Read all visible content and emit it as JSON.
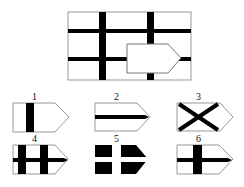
{
  "puzzle": {
    "main_figure": {
      "description": "rectangle grid with thick lines and a pentagon-shaped cutout",
      "frame": {
        "x": 68,
        "y": 12,
        "w": 123,
        "h": 68
      },
      "vertical_bars": [
        {
          "x": 99,
          "w": 7
        },
        {
          "x": 147,
          "w": 7
        }
      ],
      "horizontal_bars": [
        {
          "y": 29,
          "h": 4
        },
        {
          "y": 57,
          "h": 4
        }
      ],
      "cutout": {
        "left": 127,
        "top": 44,
        "bottom": 73,
        "slant_x": 168,
        "tip_x": 181
      }
    },
    "options": [
      {
        "label": "1",
        "style": "single vertical bar"
      },
      {
        "label": "2",
        "style": "single horizontal bar"
      },
      {
        "label": "3",
        "style": "diagonal cross X"
      },
      {
        "label": "4",
        "style": "two vertical bars and horizontal bar"
      },
      {
        "label": "5",
        "style": "black fill with white cross"
      },
      {
        "label": "6",
        "style": "cross"
      }
    ]
  }
}
